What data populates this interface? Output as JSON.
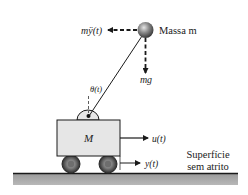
{
  "diagram": {
    "mass": {
      "label": "Massa m",
      "inertial_force_label": "mÿ(t)",
      "gravity_label": "mg"
    },
    "angle_label": "θ(t)",
    "cart": {
      "label": "M",
      "input_label": "u(t)",
      "position_label": "y(t)"
    },
    "surface": {
      "line1": "Superfície",
      "line2": "sem atrito"
    },
    "colors": {
      "line": "#1a1a1a",
      "cart_fill": "#e6e6e6",
      "ground_fill": "#a8a8a8",
      "ball_dark": "#3a3a3a",
      "ball_light": "#d8d8d8",
      "wheel_outer": "#3c3c3c",
      "wheel_inner": "#8a8a8a"
    }
  }
}
